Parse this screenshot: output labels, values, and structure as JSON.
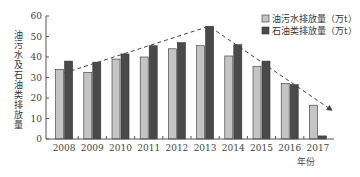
{
  "chart_data": {
    "type": "bar",
    "title": "",
    "xlabel": "年份",
    "ylabel": "油污水及石油类排放量",
    "ylim": [
      0,
      60
    ],
    "yticks": [
      0,
      10,
      20,
      30,
      40,
      50,
      60
    ],
    "grid": false,
    "legend_position": "top-right",
    "categories": [
      "2008",
      "2009",
      "2010",
      "2011",
      "2012",
      "2013",
      "2014",
      "2015",
      "2016",
      "2017"
    ],
    "series": [
      {
        "name": "油污水排放量（万t）",
        "color": "#c4c4c4",
        "values": [
          34,
          32.5,
          39,
          40,
          44,
          45.5,
          40.5,
          35.5,
          27,
          16.5
        ]
      },
      {
        "name": "石油类排放量（万t）",
        "color": "#4a4a4a",
        "values": [
          38,
          37.5,
          41.5,
          45.5,
          47,
          55,
          46,
          38,
          26.5,
          1.5
        ]
      }
    ],
    "annotations": [
      {
        "type": "dashed-trend-arrow",
        "from": "2008",
        "peak": "2013",
        "to": "2017",
        "description": "rising then falling trend line"
      }
    ]
  }
}
